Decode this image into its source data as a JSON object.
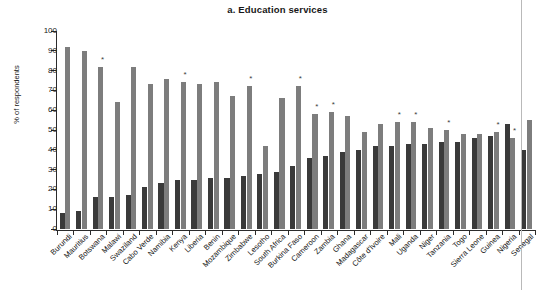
{
  "chart_data": {
    "type": "bar",
    "title": "a. Education services",
    "xlabel": "",
    "ylabel": "% of respondents",
    "ylim": [
      0,
      100
    ],
    "ytick_values": [
      0,
      10,
      20,
      30,
      40,
      50,
      60,
      70,
      80,
      90,
      100
    ],
    "grid": false,
    "legend_position": "none",
    "orientation": "vertical",
    "grouping": "paired",
    "categories": [
      "Burundi",
      "Mauritius",
      "Botswana",
      "Malawi",
      "Swaziland",
      "Cabo Verde",
      "Namibia",
      "Kenya",
      "Liberia",
      "Benin",
      "Mozambique",
      "Zimbabwe",
      "Lesotho",
      "South Africa",
      "Burkina Faso",
      "Cameroon",
      "Zambia",
      "Ghana",
      "Madagascar",
      "Côte d'Ivoire",
      "Mali",
      "Uganda",
      "Niger",
      "Tanzania",
      "Togo",
      "Sierra Leone",
      "Guinea",
      "Nigeria",
      "Senegal"
    ],
    "series": [
      {
        "name": "dark",
        "color": "#3a3a3a",
        "values": [
          8,
          9,
          16,
          16,
          17,
          21,
          23,
          25,
          25,
          26,
          26,
          27,
          28,
          29,
          32,
          36,
          37,
          39,
          40,
          42,
          42,
          43,
          43,
          44,
          44,
          46,
          47,
          53,
          40
        ]
      },
      {
        "name": "light",
        "color": "#7d7d7d",
        "values": [
          92,
          90,
          82,
          64,
          82,
          73,
          76,
          74,
          73,
          74,
          67,
          72,
          42,
          66,
          72,
          58,
          59,
          57,
          49,
          53,
          54,
          54,
          51,
          50,
          48,
          48,
          49,
          46,
          55
        ]
      }
    ],
    "starred_categories": [
      "Botswana",
      "Kenya",
      "Zimbabwe",
      "Burkina Faso",
      "Cameroon",
      "Zambia",
      "Mali",
      "Uganda",
      "Tanzania",
      "Guinea",
      "Nigeria"
    ],
    "annotations": {
      "star_glyph": "*"
    }
  },
  "figure": {
    "title": "a. Education services",
    "y_axis_title": "% of respondents"
  }
}
